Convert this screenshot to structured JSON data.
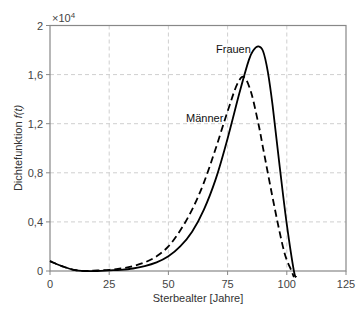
{
  "chart_data": {
    "type": "line",
    "title": "",
    "xlabel": "Sterbealter [Jahre]",
    "ylabel": "Dichtefunktion f(t)",
    "ylabel_parts": {
      "text": "Dichtefunktion ",
      "italic": "f(t)"
    },
    "y_multiplier": "×10",
    "y_multiplier_exp": "4",
    "xlim": [
      0,
      125
    ],
    "ylim": [
      0,
      2
    ],
    "x_ticks": [
      0,
      25,
      50,
      75,
      100,
      125
    ],
    "x_tick_labels": [
      "0",
      "25",
      "50",
      "75",
      "100",
      "125"
    ],
    "y_ticks": [
      0,
      0.4,
      0.8,
      1.2,
      1.6,
      2
    ],
    "y_tick_labels": [
      "0",
      "0,4",
      "0,8",
      "1,2",
      "1,6",
      "2"
    ],
    "grid": true,
    "legend": "inline annotations",
    "series": [
      {
        "name": "Frauen",
        "style": "solid",
        "color": "#000000",
        "x": [
          0,
          5,
          10,
          15,
          20,
          25,
          30,
          35,
          40,
          45,
          50,
          55,
          60,
          65,
          70,
          75,
          80,
          84,
          86,
          88,
          90,
          92,
          94,
          97,
          100,
          103,
          104
        ],
        "values": [
          0.08,
          0.04,
          0.01,
          0.0,
          0.0,
          0.005,
          0.01,
          0.02,
          0.04,
          0.07,
          0.12,
          0.2,
          0.32,
          0.5,
          0.75,
          1.08,
          1.45,
          1.72,
          1.8,
          1.83,
          1.79,
          1.62,
          1.35,
          0.85,
          0.38,
          0.0,
          -0.05
        ]
      },
      {
        "name": "Männer",
        "style": "dashed",
        "color": "#000000",
        "x": [
          0,
          5,
          10,
          15,
          20,
          25,
          30,
          35,
          40,
          45,
          50,
          55,
          60,
          65,
          70,
          75,
          79,
          82,
          85,
          88,
          90,
          95,
          99,
          102,
          103
        ],
        "values": [
          0.08,
          0.04,
          0.01,
          0.0,
          0.005,
          0.01,
          0.02,
          0.04,
          0.07,
          0.12,
          0.2,
          0.33,
          0.5,
          0.72,
          1.0,
          1.3,
          1.52,
          1.58,
          1.45,
          1.2,
          1.0,
          0.5,
          0.15,
          0.0,
          -0.05
        ]
      }
    ],
    "annotations": [
      {
        "text": "Frauen",
        "x_px": 216,
        "y_px": 53
      },
      {
        "text": "Männer",
        "x_px": 186,
        "y_px": 122
      }
    ]
  }
}
